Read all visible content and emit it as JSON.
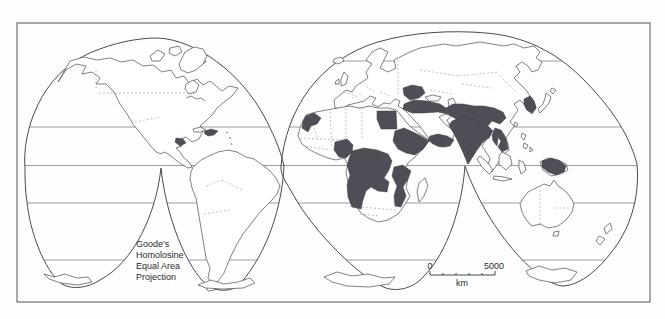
{
  "figure": {
    "kind": "world-map",
    "projection_label": {
      "line1": "Goode's",
      "line2": "Homolosine",
      "line3": "Equal Area",
      "line4": "Projection"
    },
    "scale_bar": {
      "start_label": "0",
      "end_label": "5000",
      "unit_label": "km"
    },
    "colors": {
      "shaded_region": "#4e4e56",
      "coastline": "#4a4a4a",
      "background": "#ffffff",
      "frame": "#6e6e6e"
    },
    "shaded_regions": [
      "hispaniola",
      "central-america",
      "balkans",
      "turkey-to-pakistan",
      "india",
      "burma-coast",
      "sri-lanka",
      "egypt",
      "morocco",
      "yemen-oman",
      "horn-of-africa",
      "nigeria",
      "congo-angola-zambia-namibia",
      "tanzania-mozambique",
      "korea",
      "vietnam",
      "new-guinea"
    ],
    "latitude_lines": [
      "arctic-circle",
      "tropic-of-cancer",
      "equator",
      "tropic-of-capricorn",
      "antarctic-circle"
    ]
  }
}
